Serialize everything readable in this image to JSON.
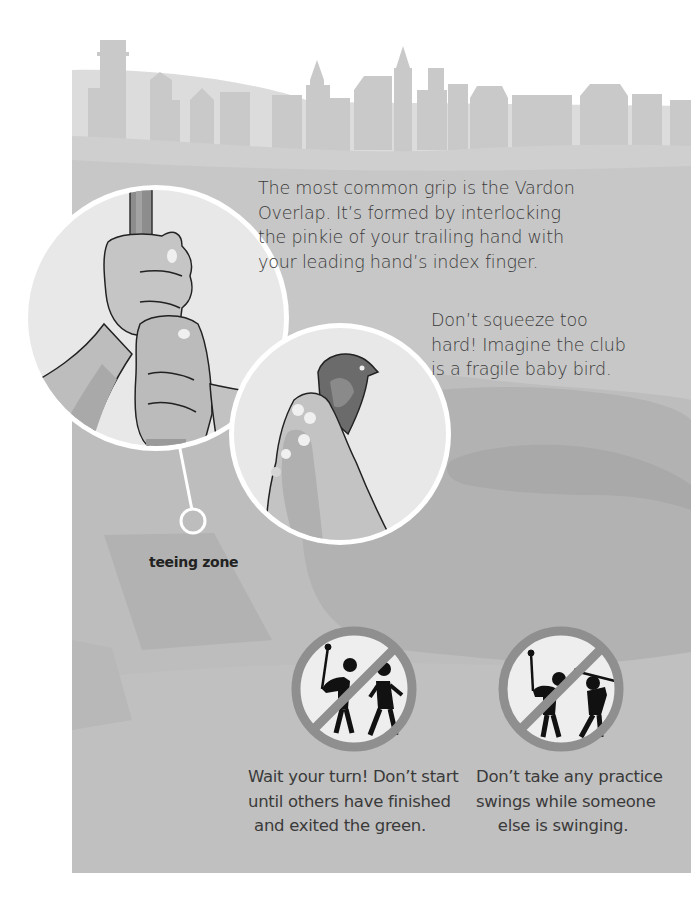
{
  "illustration": {
    "skyline_desc": "town skyline silhouette",
    "colors": {
      "page": "#ffffff",
      "skyline": "#c8c8c8",
      "grass_light": "#c4c4c4",
      "grass_mid": "#b5b5b5",
      "grass_dark": "#a8a8a8",
      "circle_border": "#ffffff",
      "circle_fill": "#e9e9e9",
      "sign_ring": "#8f8f8f",
      "sign_fill": "#eeeeee",
      "figure": "#111111"
    }
  },
  "grip": {
    "text_lines": [
      "The most common grip is the Vardon",
      "Overlap. It’s formed by interlocking",
      "the pinkie of your trailing hand with",
      "your leading hand’s index finger."
    ]
  },
  "pressure": {
    "text_lines": [
      "Don’t squeeze too",
      "hard! Imagine the club",
      "is a fragile baby bird."
    ]
  },
  "teeing": {
    "label": "teeing zone"
  },
  "rules": [
    {
      "icon": "no-walking-while-swinging-icon",
      "lines": [
        "Wait your turn! Don’t start",
        "until others have finished",
        "and exited the green."
      ]
    },
    {
      "icon": "no-practice-swing-icon",
      "lines": [
        "Don’t take any practice",
        "swings while someone",
        "else is swinging."
      ]
    }
  ]
}
